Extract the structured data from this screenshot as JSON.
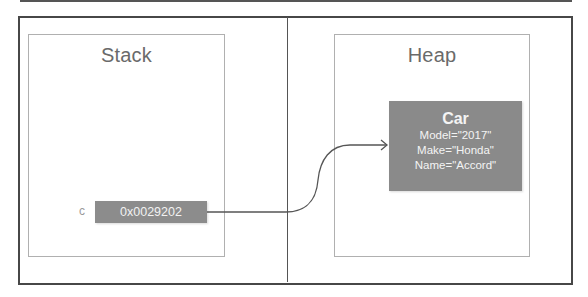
{
  "diagram": {
    "stack": {
      "title": "Stack",
      "variable": {
        "name": "c",
        "value": "0x0029202"
      }
    },
    "heap": {
      "title": "Heap",
      "object": {
        "type": "Car",
        "fields": [
          "Model=\"2017\"",
          "Make=\"Honda\"",
          "Name=\"Accord\""
        ]
      }
    },
    "arrow": {
      "from": "stack.variable",
      "to": "heap.object"
    },
    "colors": {
      "frame": "#474747",
      "region_border": "#b0b0b0",
      "title_text": "#6a6a6a",
      "box_fill": "#8a8a8a",
      "box_text": "#f4f4f4",
      "arrow": "#555555"
    }
  }
}
